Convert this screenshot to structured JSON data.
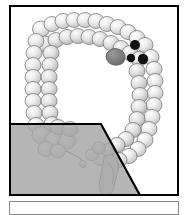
{
  "figure": {
    "alt_description": "Schematic drawing of the large intestine with haustral segmentation, showing ascending, transverse, descending and sigmoid colon, cecum and appendix, with a translucent gray overlay panel covering the lower-left quadrant.",
    "caption": "",
    "panel_border_color": "#000000",
    "background_color": "#ffffff"
  },
  "colors": {
    "outline": "#6e6e6e",
    "haustra_light": "#f2f2f2",
    "haustra_mid": "#d8d8d8",
    "haustra_shadow": "#b4b4b4",
    "overlay_gray": "#a5a5a5",
    "overlay_edge": "#000000",
    "lesion_gray": "#7a7a7a",
    "marker_black": "#111111",
    "caption_border": "#8c8c8c"
  },
  "markers": {
    "lesion": {
      "name": "lesion",
      "label": "",
      "color": "#7a7a7a",
      "cx": 104,
      "cy": 50,
      "rx": 9,
      "ry": 7
    },
    "dots": [
      {
        "name": "marker-dot-1",
        "label": "",
        "color": "#111111",
        "cx": 131,
        "cy": 43,
        "r": 5
      },
      {
        "name": "marker-dot-2",
        "label": "",
        "color": "#111111",
        "cx": 127,
        "cy": 55,
        "r": 4
      },
      {
        "name": "marker-dot-3",
        "label": "",
        "color": "#111111",
        "cx": 139,
        "cy": 56,
        "r": 5.5
      }
    ]
  },
  "overlay": {
    "name": "gray-overlay-panel",
    "label": "",
    "fill": "#a5a5a5",
    "opacity": 0.82,
    "points": "0,122 93,122 132,196 0,196"
  },
  "segments": [
    {
      "name": "ascending-colon",
      "label": ""
    },
    {
      "name": "transverse-colon",
      "label": ""
    },
    {
      "name": "descending-colon",
      "label": ""
    },
    {
      "name": "sigmoid-colon",
      "label": ""
    },
    {
      "name": "cecum",
      "label": ""
    },
    {
      "name": "appendix",
      "label": ""
    },
    {
      "name": "rectum",
      "label": ""
    }
  ]
}
